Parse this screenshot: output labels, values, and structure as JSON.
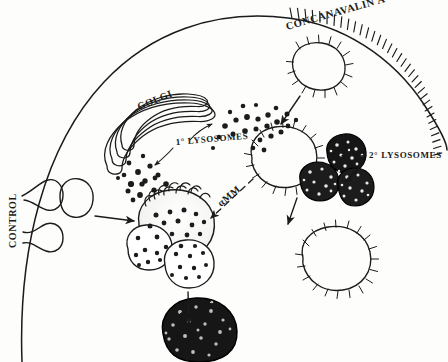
{
  "figure": {
    "background_color": "#fdfdfb",
    "ink_color": "#1a1a1a",
    "width": 448,
    "height": 362
  },
  "labels": {
    "concanavalin_a": "CONCANAVALIN A",
    "golgi": "GOLGI",
    "primary_lysosomes": "1° LYSOSOMES",
    "secondary_lysosomes": "2° LYSOSOMES",
    "control": "CONTROL",
    "amm": "αMM"
  },
  "structures": [
    {
      "name": "cell-membrane",
      "kind": "arc",
      "note": "large smooth arc, Con A spikes along upper-right portion"
    },
    {
      "name": "con-a-spikes",
      "kind": "bristles",
      "count": 34,
      "note": "ligand tick marks on membrane from top-centre to right edge"
    },
    {
      "name": "golgi-stack",
      "kind": "cisternae",
      "count": 4,
      "note": "curved stacked flattened sacs, centre-left"
    },
    {
      "name": "primary-lysosome-dots",
      "kind": "dot-field",
      "count": 44,
      "note": "small filled dots around Golgi and below"
    },
    {
      "name": "control-invagination-vesicle",
      "kind": "plain-vesicle",
      "note": "small smooth vesicle at left membrane pit"
    },
    {
      "name": "coated-endocytic-vesicle-top",
      "kind": "spiky-vesicle",
      "note": "budding vesicle under the Con A coated membrane"
    },
    {
      "name": "spiky-vesicle-centre",
      "kind": "spiky-vesicle",
      "note": "large empty bristled vesicle, centre-right"
    },
    {
      "name": "spiky-vesicle-lower-right",
      "kind": "spiky-vesicle",
      "note": "large empty bristled vesicle, lower right"
    },
    {
      "name": "secondary-lysosome-dark-1",
      "kind": "dark-granular-body"
    },
    {
      "name": "secondary-lysosome-dark-2",
      "kind": "dark-granular-body"
    },
    {
      "name": "secondary-lysosome-dark-3",
      "kind": "dark-granular-body"
    },
    {
      "name": "stippled-phagosome",
      "kind": "stippled-vesicle",
      "note": "large pale stippled body with three dotted lobes, centre-bottom"
    },
    {
      "name": "residual-body",
      "kind": "dark-granular-body",
      "note": "large solid black granular body at bottom"
    }
  ],
  "arrows": [
    {
      "name": "arrow-control-to-cell",
      "style": "solid",
      "from": "control-invagination-vesicle",
      "to": "stippled-phagosome"
    },
    {
      "name": "arrow-membrane-to-vesicle",
      "style": "solid",
      "from": "coated-endocytic-vesicle-top",
      "to": "spiky-vesicle-centre"
    },
    {
      "name": "arrow-primary-lysosome-left",
      "style": "solid",
      "from": "primary-lysosomes-label",
      "to": "dot-field-left"
    },
    {
      "name": "arrow-primary-lysosome-right",
      "style": "solid",
      "from": "primary-lysosomes-label",
      "to": "dot-field-right"
    },
    {
      "name": "arrow-secondary-lysosome-upper",
      "style": "solid",
      "from": "secondary-lysosomes-label",
      "to": "secondary-lysosome-dark-1"
    },
    {
      "name": "arrow-secondary-lysosome-lower",
      "style": "solid",
      "from": "secondary-lysosomes-label",
      "to": "secondary-lysosome-dark-2"
    },
    {
      "name": "arrow-amm-dashed",
      "style": "dashed",
      "from": "spiky-vesicle-centre",
      "to": "stippled-phagosome",
      "label": "αMM"
    },
    {
      "name": "arrow-vesicle-to-lower-right",
      "style": "solid",
      "from": "spiky-vesicle-centre",
      "to": "spiky-vesicle-lower-right"
    },
    {
      "name": "arrow-phagosome-to-residual-body",
      "style": "solid",
      "from": "stippled-phagosome",
      "to": "residual-body"
    }
  ]
}
